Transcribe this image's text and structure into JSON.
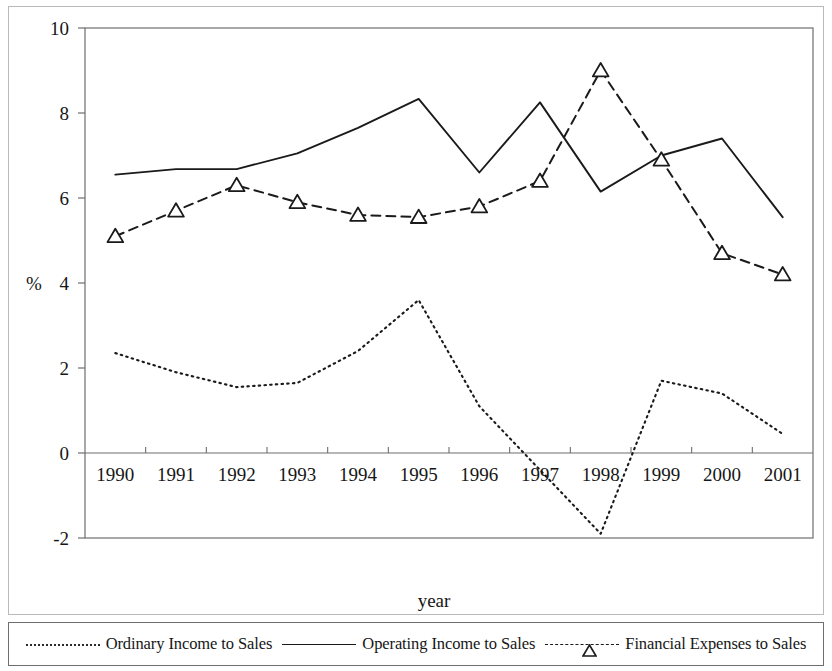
{
  "figure": {
    "axis_label_y": "%",
    "axis_label_x": "year"
  },
  "legend": {
    "items": [
      {
        "label": "Ordinary Income to Sales",
        "style": "dotted",
        "marker": "none"
      },
      {
        "label": "Operating Income to Sales",
        "style": "solid",
        "marker": "none"
      },
      {
        "label": "Financial Expenses to Sales",
        "style": "dashed",
        "marker": "triangle"
      }
    ]
  },
  "colors": {
    "ink": "#1a1a1a",
    "frame": "#6e6e6e",
    "scan_border": "#b9b9b9",
    "background": "#ffffff"
  },
  "chart_data": {
    "type": "line",
    "title": "",
    "xlabel": "year",
    "ylabel": "%",
    "grid": false,
    "legend_position": "bottom",
    "categories": [
      "1990",
      "1991",
      "1992",
      "1993",
      "1994",
      "1995",
      "1996",
      "1997",
      "1998",
      "1999",
      "2000",
      "2001"
    ],
    "x": [
      1990,
      1991,
      1992,
      1993,
      1994,
      1995,
      1996,
      1997,
      1998,
      1999,
      2000,
      2001
    ],
    "ylim": [
      -2,
      10
    ],
    "yticks": [
      -2,
      0,
      2,
      4,
      6,
      8,
      10
    ],
    "ytick_labels": [
      "-2",
      "0",
      "2",
      "4",
      "6",
      "8",
      "10"
    ],
    "series": [
      {
        "name": "Ordinary Income to Sales",
        "style": "dotted",
        "marker": "none",
        "values": [
          2.35,
          1.9,
          1.55,
          1.65,
          2.4,
          3.6,
          1.1,
          -0.4,
          -1.9,
          1.7,
          1.4,
          0.45
        ]
      },
      {
        "name": "Operating Income to Sales",
        "style": "solid",
        "marker": "none",
        "values": [
          6.55,
          6.68,
          6.68,
          7.05,
          7.65,
          8.33,
          6.6,
          8.25,
          6.15,
          7.0,
          7.4,
          5.55
        ]
      },
      {
        "name": "Financial Expenses to Sales",
        "style": "dashed",
        "marker": "triangle",
        "values": [
          5.1,
          5.7,
          6.3,
          5.9,
          5.6,
          5.55,
          5.8,
          6.4,
          9.0,
          6.9,
          4.7,
          4.2
        ]
      }
    ]
  }
}
